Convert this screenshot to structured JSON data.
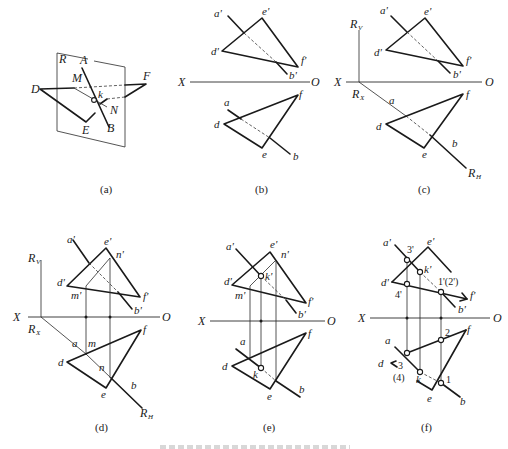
{
  "figure": {
    "panels": [
      {
        "id": "a",
        "caption": "(a)",
        "labels": {
          "plane": "R",
          "A": "A",
          "B": "B",
          "D": "D",
          "E": "E",
          "F": "F",
          "M": "M",
          "N": "N",
          "k": "k"
        }
      },
      {
        "id": "b",
        "caption": "(b)",
        "labels": {
          "X": "X",
          "O": "O",
          "a1": "a'",
          "b1": "b'",
          "d1": "d'",
          "e1": "e'",
          "f1": "f'",
          "a": "a",
          "b": "b",
          "d": "d",
          "e": "e",
          "f": "f"
        }
      },
      {
        "id": "c",
        "caption": "(c)",
        "labels": {
          "X": "X",
          "O": "O",
          "RV": "R",
          "RV_sub": "V",
          "RX": "R",
          "RX_sub": "X",
          "RH": "R",
          "RH_sub": "H",
          "a1": "a'",
          "b1": "b'",
          "d1": "d'",
          "e1": "e'",
          "f1": "f'",
          "a": "a",
          "b": "b",
          "d": "d",
          "e": "e",
          "f": "f"
        }
      },
      {
        "id": "d",
        "caption": "(d)",
        "labels": {
          "X": "X",
          "O": "O",
          "RV": "R",
          "RV_sub": "V",
          "RX": "R",
          "RX_sub": "X",
          "RH": "R",
          "RH_sub": "H",
          "a1": "a'",
          "b1": "b'",
          "d1": "d'",
          "e1": "e'",
          "f1": "f'",
          "m1": "m'",
          "n1": "n'",
          "a": "a",
          "b": "b",
          "d": "d",
          "e": "e",
          "f": "f",
          "m": "m",
          "n": "n"
        }
      },
      {
        "id": "e",
        "caption": "(e)",
        "labels": {
          "X": "X",
          "O": "O",
          "a1": "a'",
          "b1": "b'",
          "d1": "d'",
          "e1": "e'",
          "f1": "f'",
          "m1": "m'",
          "n1": "n'",
          "k1": "k'",
          "a": "a",
          "b": "b",
          "d": "d",
          "e": "e",
          "f": "f",
          "k": "k"
        }
      },
      {
        "id": "f",
        "caption": "(f)",
        "labels": {
          "X": "X",
          "O": "O",
          "a1": "a'",
          "b1": "b'",
          "d1": "d'",
          "e1": "e'",
          "f1": "f'",
          "k1": "k'",
          "p3v": "3'",
          "p4v": "4'",
          "p12v": "1'(2')",
          "a": "a",
          "b": "b",
          "d": "d",
          "e": "e",
          "f": "f",
          "k": "k",
          "p1": "1",
          "p2": "2",
          "p3": "3",
          "p4": "(4)"
        }
      }
    ]
  },
  "colors": {
    "ink": "#1a1a1a",
    "background": "#ffffff"
  }
}
